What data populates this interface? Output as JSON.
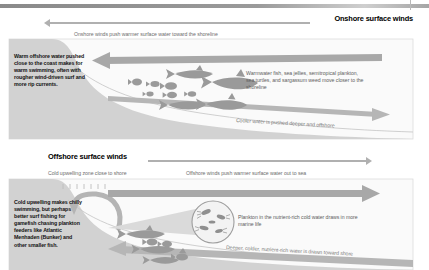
{
  "diagram": {
    "colors": {
      "land": "#cfcfcf",
      "water": "#f2f2f2",
      "arrow": "#a8a8a8",
      "fish": "#9a9a9a",
      "panel_border": "#d8d8d8",
      "caption_text": "#6e6e6e",
      "body_text": "#111111"
    }
  },
  "panels": [
    {
      "id": "onshore",
      "wind_label": "Onshore surface winds",
      "wind_direction": "left",
      "caption_top": "Onshore winds push warmer surface water toward the shoreline",
      "body_text": "Warm offshore water pushed close to the coast makes for warm swimming, often with rougher wind-driven surf and more rip currents.",
      "side_text": "Warmwater fish, sea jellies, semitropical plankton, sea turtles, and sargassum weed move closer to the shoreline",
      "slant_text": "Cooler water is pushed deeper and offshore",
      "surface_arrow_direction": "left",
      "deep_arrow_direction": "right"
    },
    {
      "id": "offshore",
      "wind_label": "Offshore surface winds",
      "wind_direction": "right",
      "caption_upwelling": "Cold upwelling zone close to shore",
      "caption_top": "Offshore winds push warmer surface water out to sea",
      "body_text": "Cold upwelling makes chilly swimming, but perhaps better surf fishing for gamefish chasing plankton feeders like Atlantic Menhaden (Bunker) and other smaller fish.",
      "side_text": "Plankton in the nutrient-rich cold water draws in more marine life",
      "slant_text": "Deeper, colder, nutrient-rich water is drawn toward shore",
      "surface_arrow_direction": "right",
      "deep_arrow_direction": "left"
    }
  ]
}
